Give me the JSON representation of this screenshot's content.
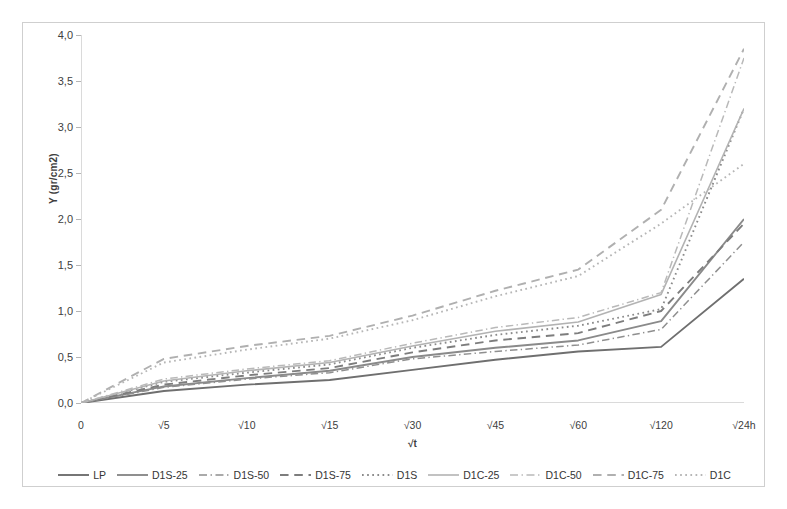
{
  "chart_data": {
    "type": "line",
    "title": "",
    "xlabel": "√t",
    "ylabel": "Y (gr/cm2)",
    "categories": [
      "0",
      "√5",
      "√10",
      "√15",
      "√30",
      "√45",
      "√60",
      "√120",
      "√24h"
    ],
    "ytick_labels": [
      "0,0",
      "0,5",
      "1,0",
      "1,5",
      "2,0",
      "2,5",
      "3,0",
      "3,5",
      "4,0"
    ],
    "ylim": [
      0,
      4
    ],
    "ytick_step": 0.5,
    "grid": false,
    "legend_position": "bottom",
    "series": [
      {
        "name": "LP",
        "style": "solid",
        "color": "#6f6f6f",
        "width": 1.9,
        "values": [
          0.0,
          0.13,
          0.2,
          0.25,
          0.36,
          0.47,
          0.56,
          0.61,
          1.35
        ]
      },
      {
        "name": "D1S-25",
        "style": "solid",
        "color": "#8a8a8a",
        "width": 1.9,
        "values": [
          0.0,
          0.18,
          0.27,
          0.35,
          0.5,
          0.6,
          0.68,
          0.89,
          2.0
        ]
      },
      {
        "name": "D1S-50",
        "style": "dashdot",
        "color": "#8f8f8f",
        "width": 1.5,
        "values": [
          0.0,
          0.17,
          0.26,
          0.33,
          0.48,
          0.56,
          0.63,
          0.8,
          1.75
        ]
      },
      {
        "name": "D1S-75",
        "style": "dashed",
        "color": "#7d7d7d",
        "width": 1.9,
        "values": [
          0.0,
          0.2,
          0.3,
          0.38,
          0.55,
          0.68,
          0.76,
          1.0,
          1.95
        ]
      },
      {
        "name": "D1S",
        "style": "dotted",
        "color": "#8b8b8b",
        "width": 1.9,
        "values": [
          0.0,
          0.23,
          0.33,
          0.42,
          0.6,
          0.74,
          0.84,
          1.02,
          3.2
        ]
      },
      {
        "name": "D1C-25",
        "style": "solid",
        "color": "#b3b3b3",
        "width": 1.6,
        "values": [
          0.0,
          0.24,
          0.35,
          0.44,
          0.62,
          0.78,
          0.88,
          1.18,
          3.2
        ]
      },
      {
        "name": "D1C-50",
        "style": "dashdot",
        "color": "#b9b9b9",
        "width": 1.5,
        "values": [
          0.0,
          0.26,
          0.37,
          0.46,
          0.65,
          0.82,
          0.93,
          1.2,
          3.75
        ]
      },
      {
        "name": "D1C-75",
        "style": "dashed",
        "color": "#b0b0b0",
        "width": 1.9,
        "values": [
          0.0,
          0.48,
          0.62,
          0.73,
          0.95,
          1.22,
          1.45,
          2.1,
          3.85
        ]
      },
      {
        "name": "D1C",
        "style": "dotted",
        "color": "#b6b6b6",
        "width": 1.9,
        "values": [
          0.0,
          0.44,
          0.58,
          0.7,
          0.9,
          1.16,
          1.38,
          1.95,
          2.6
        ]
      }
    ]
  },
  "legend": {
    "items": [
      {
        "label": "LP"
      },
      {
        "label": "D1S-25"
      },
      {
        "label": "D1S-50"
      },
      {
        "label": "D1S-75"
      },
      {
        "label": "D1S"
      },
      {
        "label": "D1C-25"
      },
      {
        "label": "D1C-50"
      },
      {
        "label": "D1C-75"
      },
      {
        "label": "D1C"
      }
    ]
  },
  "colors": {
    "frame": "#cfcfcf",
    "axis": "#b5b5b5",
    "text": "#3f3f3f",
    "background": "#ffffff"
  }
}
